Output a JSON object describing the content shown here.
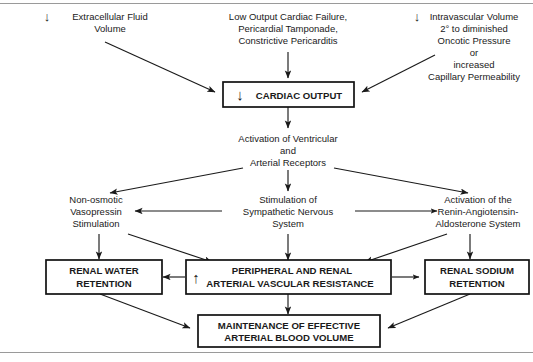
{
  "figure": {
    "colors": {
      "background": "#ffffff",
      "ink": "#1a1a1a",
      "box_stroke": "#111111",
      "rule": "#9a9a9a"
    }
  },
  "glyphs": {
    "down_arrow": "↓",
    "up_arrow": "↑"
  },
  "nodes": {
    "extracellular_fluid": {
      "name": "extracellular-fluid-volume",
      "arrow": "↓",
      "lines": [
        "Extracellular Fluid",
        "Volume"
      ]
    },
    "low_output": {
      "name": "low-output-cardiac-failure",
      "lines": [
        "Low Output Cardiac Failure,",
        "Pericardial Tamponade,",
        "Constrictive Pericarditis"
      ]
    },
    "intravascular_volume": {
      "name": "intravascular-volume",
      "arrow": "↓",
      "lines": [
        "Intravascular Volume",
        "2° to diminished",
        "Oncotic Pressure",
        "or",
        "increased",
        "Capillary Permeability"
      ]
    },
    "cardiac_output": {
      "name": "cardiac-output-box",
      "arrow": "↓",
      "lines": [
        "CARDIAC OUTPUT"
      ],
      "boxed": true
    },
    "receptor_activation": {
      "name": "activation-of-receptors",
      "lines": [
        "Activation of Ventricular",
        "and",
        "Arterial Receptors"
      ]
    },
    "vasopressin": {
      "name": "non-osmotic-vasopressin-stimulation",
      "lines": [
        "Non-osmotic",
        "Vasopressin",
        "Stimulation"
      ]
    },
    "sympathetic": {
      "name": "sympathetic-nervous-system-stimulation",
      "lines": [
        "Stimulation of",
        "Sympathetic Nervous",
        "System"
      ]
    },
    "raas": {
      "name": "renin-angiotensin-aldosterone-activation",
      "lines": [
        "Activation of the",
        "Renin-Angiotensin-",
        "Aldosterone System"
      ]
    },
    "renal_water": {
      "name": "renal-water-retention-box",
      "lines": [
        "RENAL WATER",
        "RETENTION"
      ],
      "boxed": true
    },
    "vascular_resistance": {
      "name": "arterial-vascular-resistance-box",
      "arrow": "↑",
      "lines": [
        "PERIPHERAL AND RENAL",
        "ARTERIAL VASCULAR RESISTANCE"
      ],
      "boxed": true
    },
    "renal_sodium": {
      "name": "renal-sodium-retention-box",
      "lines": [
        "RENAL SODIUM",
        "RETENTION"
      ],
      "boxed": true
    },
    "maintenance": {
      "name": "maintenance-effective-arterial-blood-volume-box",
      "lines": [
        "MAINTENANCE OF EFFECTIVE",
        "ARTERIAL BLOOD VOLUME"
      ],
      "boxed": true
    }
  }
}
